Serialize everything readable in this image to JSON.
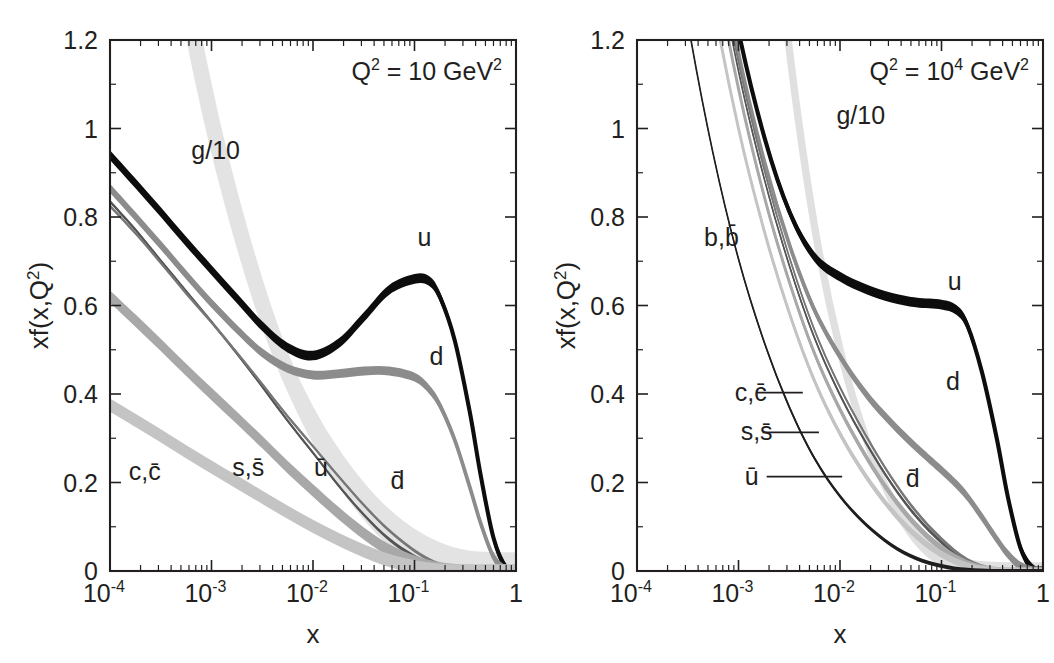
{
  "figure": {
    "background": "#ffffff",
    "ink": "#231f20"
  },
  "chart_data": [
    {
      "type": "line",
      "panel": "left",
      "title": "",
      "annotation": "Q² = 10 GeV²",
      "annotation_base": "Q",
      "annotation_exp1": "2",
      "annotation_mid": " = 10 GeV",
      "annotation_exp2": "2",
      "xlabel": "x",
      "ylabel": "xf(x,Q²)",
      "ylabel_base": "xf(x,Q",
      "ylabel_sup": "2",
      "ylabel_tail": ")",
      "xscale": "log",
      "xlim": [
        0.0001,
        1
      ],
      "ylim": [
        0,
        1.2
      ],
      "grid": false,
      "legend": "inline-labels",
      "xticks": [
        "10‑4",
        "10‑3",
        "10‑2",
        "10‑1",
        "1"
      ],
      "xtick_bases": [
        "10",
        "10",
        "10",
        "10",
        "1"
      ],
      "xtick_exps": [
        "-4",
        "-3",
        "-2",
        "-1",
        ""
      ],
      "xtick_values": [
        0.0001,
        0.001,
        0.01,
        0.1,
        1
      ],
      "yticks": [
        "0",
        "0.2",
        "0.4",
        "0.6",
        "0.8",
        "1",
        "1.2"
      ],
      "ytick_values": [
        0,
        0.2,
        0.4,
        0.6,
        0.8,
        1.0,
        1.2
      ],
      "series": [
        {
          "name": "g/10",
          "label": "g/10",
          "color": "#e3e3e3",
          "band": 0.085,
          "label_x": 0.0011,
          "label_y": 0.93,
          "leader": false,
          "x": [
            0.0001,
            0.00018,
            0.00032,
            0.00056,
            0.001,
            0.0018,
            0.0032,
            0.0056,
            0.01,
            0.018,
            0.032,
            0.056,
            0.1,
            0.18,
            0.32,
            0.56,
            1.0
          ],
          "y": [
            2.55,
            2.05,
            1.64,
            1.3,
            1.02,
            0.79,
            0.6,
            0.45,
            0.33,
            0.233,
            0.157,
            0.098,
            0.053,
            0.022,
            0.005,
            0.0004,
            0.0
          ]
        },
        {
          "name": "u",
          "label": "u",
          "color": "#0d0d0d",
          "band": 0.022,
          "label_x": 0.125,
          "label_y": 0.735,
          "leader": false,
          "x": [
            0.0001,
            0.00018,
            0.00032,
            0.00056,
            0.001,
            0.0018,
            0.0032,
            0.0056,
            0.01,
            0.018,
            0.032,
            0.056,
            0.1,
            0.14,
            0.18,
            0.25,
            0.35,
            0.45,
            0.6,
            0.8,
            1.0
          ],
          "y": [
            0.94,
            0.875,
            0.81,
            0.745,
            0.68,
            0.615,
            0.552,
            0.505,
            0.487,
            0.515,
            0.575,
            0.635,
            0.66,
            0.655,
            0.617,
            0.52,
            0.36,
            0.215,
            0.075,
            0.006,
            0.0
          ]
        },
        {
          "name": "d",
          "label": "d",
          "color": "#8c8c8c",
          "band": 0.02,
          "label_x": 0.165,
          "label_y": 0.465,
          "leader": false,
          "x": [
            0.0001,
            0.00018,
            0.00032,
            0.00056,
            0.001,
            0.0018,
            0.0032,
            0.0056,
            0.01,
            0.018,
            0.032,
            0.056,
            0.1,
            0.14,
            0.18,
            0.25,
            0.35,
            0.45,
            0.6,
            0.8,
            1.0
          ],
          "y": [
            0.865,
            0.8,
            0.735,
            0.67,
            0.605,
            0.545,
            0.492,
            0.458,
            0.443,
            0.446,
            0.452,
            0.452,
            0.438,
            0.41,
            0.372,
            0.295,
            0.19,
            0.107,
            0.032,
            0.002,
            0.0
          ]
        },
        {
          "name": "ubar",
          "label": "ū",
          "color": "#555555",
          "band": 0.008,
          "label_x": 0.012,
          "label_y": 0.215,
          "leader": false,
          "x": [
            0.0001,
            0.00018,
            0.00032,
            0.00056,
            0.001,
            0.0018,
            0.0032,
            0.0056,
            0.01,
            0.018,
            0.032,
            0.056,
            0.1,
            0.18,
            0.32,
            0.56,
            1.0
          ],
          "y": [
            0.835,
            0.77,
            0.7,
            0.633,
            0.563,
            0.49,
            0.415,
            0.34,
            0.267,
            0.192,
            0.126,
            0.072,
            0.033,
            0.0095,
            0.0012,
            0.0,
            0.0
          ]
        },
        {
          "name": "dbar",
          "label": "d̄",
          "color": "#777777",
          "band": 0.008,
          "label_x": 0.068,
          "label_y": 0.185,
          "leader": false,
          "x": [
            0.0001,
            0.00018,
            0.00032,
            0.00056,
            0.001,
            0.0018,
            0.0032,
            0.0056,
            0.01,
            0.018,
            0.032,
            0.056,
            0.1,
            0.18,
            0.32,
            0.56,
            1.0
          ],
          "y": [
            0.825,
            0.762,
            0.695,
            0.628,
            0.562,
            0.492,
            0.421,
            0.35,
            0.282,
            0.213,
            0.148,
            0.092,
            0.046,
            0.0145,
            0.002,
            0.0,
            0.0
          ]
        },
        {
          "name": "s,sbar",
          "label": "s,s̄",
          "color": "#a8a8a8",
          "band": 0.028,
          "label_x": 0.0023,
          "label_y": 0.215,
          "leader": false,
          "x": [
            0.0001,
            0.00018,
            0.00032,
            0.00056,
            0.001,
            0.0018,
            0.0032,
            0.0056,
            0.01,
            0.018,
            0.032,
            0.056,
            0.1,
            0.18,
            0.32,
            0.56,
            1.0
          ],
          "y": [
            0.62,
            0.565,
            0.51,
            0.455,
            0.4,
            0.345,
            0.29,
            0.235,
            0.182,
            0.13,
            0.084,
            0.047,
            0.021,
            0.006,
            0.0007,
            0.0,
            0.0
          ]
        },
        {
          "name": "c,cbar",
          "label": "c,c̄",
          "color": "#c4c4c4",
          "band": 0.03,
          "label_x": 0.00022,
          "label_y": 0.205,
          "leader": false,
          "x": [
            0.0001,
            0.00018,
            0.00032,
            0.00056,
            0.001,
            0.0018,
            0.0032,
            0.0056,
            0.01,
            0.018,
            0.032,
            0.056,
            0.1,
            0.18,
            0.32,
            0.56,
            1.0
          ],
          "y": [
            0.375,
            0.34,
            0.305,
            0.27,
            0.235,
            0.2,
            0.166,
            0.133,
            0.101,
            0.071,
            0.045,
            0.024,
            0.0095,
            0.002,
            0.0,
            0.0,
            0.0
          ]
        }
      ]
    },
    {
      "type": "line",
      "panel": "right",
      "title": "",
      "annotation": "Q² = 10⁴ GeV²",
      "annotation_base": "Q",
      "annotation_exp1": "2",
      "annotation_mid": " = 10",
      "annotation_exp2": "4",
      "annotation_tail": " GeV",
      "annotation_exp3": "2",
      "xlabel": "x",
      "ylabel": "xf(x,Q²)",
      "ylabel_base": "xf(x,Q",
      "ylabel_sup": "2",
      "ylabel_tail": ")",
      "xscale": "log",
      "xlim": [
        0.0001,
        1
      ],
      "ylim": [
        0,
        1.2
      ],
      "grid": false,
      "legend": "inline-labels",
      "xticks": [
        "10‑4",
        "10‑3",
        "10‑2",
        "10‑1",
        "1"
      ],
      "xtick_bases": [
        "10",
        "10",
        "10",
        "10",
        "1"
      ],
      "xtick_exps": [
        "-4",
        "-3",
        "-2",
        "-1",
        ""
      ],
      "xtick_values": [
        0.0001,
        0.001,
        0.01,
        0.1,
        1
      ],
      "yticks": [
        "0",
        "0.2",
        "0.4",
        "0.6",
        "0.8",
        "1",
        "1.2"
      ],
      "ytick_values": [
        0,
        0.2,
        0.4,
        0.6,
        0.8,
        1.0,
        1.2
      ],
      "series": [
        {
          "name": "g/10",
          "label": "g/10",
          "color": "#e0e0e0",
          "band": 0.04,
          "label_x": 0.016,
          "label_y": 1.01,
          "leader": false,
          "x": [
            0.0001,
            0.00018,
            0.00032,
            0.00056,
            0.001,
            0.0018,
            0.0032,
            0.0056,
            0.01,
            0.018,
            0.032,
            0.056,
            0.1,
            0.18,
            0.32,
            0.56,
            1.0
          ],
          "y": [
            8.6,
            6.4,
            4.7,
            3.4,
            2.43,
            1.7,
            1.17,
            0.78,
            0.5,
            0.3,
            0.163,
            0.077,
            0.029,
            0.0072,
            0.0008,
            0.0,
            0.0
          ]
        },
        {
          "name": "u",
          "label": "u",
          "color": "#0d0d0d",
          "band": 0.022,
          "label_x": 0.135,
          "label_y": 0.635,
          "leader": false,
          "x": [
            0.0001,
            0.00018,
            0.00032,
            0.00056,
            0.001,
            0.0018,
            0.0032,
            0.0056,
            0.01,
            0.018,
            0.032,
            0.056,
            0.1,
            0.14,
            0.18,
            0.25,
            0.35,
            0.45,
            0.6,
            0.8,
            1.0
          ],
          "y": [
            2.93,
            2.36,
            1.9,
            1.53,
            1.22,
            0.98,
            0.81,
            0.71,
            0.665,
            0.637,
            0.618,
            0.607,
            0.602,
            0.59,
            0.555,
            0.45,
            0.3,
            0.168,
            0.052,
            0.0035,
            0.0
          ]
        },
        {
          "name": "d",
          "label": "d",
          "color": "#8c8c8c",
          "band": 0.02,
          "label_x": 0.13,
          "label_y": 0.41,
          "leader": false,
          "x": [
            0.0001,
            0.00018,
            0.00032,
            0.00056,
            0.001,
            0.0018,
            0.0032,
            0.0056,
            0.01,
            0.018,
            0.032,
            0.056,
            0.1,
            0.14,
            0.18,
            0.25,
            0.35,
            0.45,
            0.6,
            0.8,
            1.0
          ],
          "y": [
            2.88,
            2.31,
            1.85,
            1.48,
            1.17,
            0.925,
            0.735,
            0.59,
            0.485,
            0.4,
            0.335,
            0.28,
            0.228,
            0.196,
            0.168,
            0.122,
            0.072,
            0.038,
            0.011,
            0.0007,
            0.0
          ]
        },
        {
          "name": "ubar",
          "label": "ū",
          "color": "#555555",
          "band": 0.009,
          "label_x": 0.00115,
          "label_y": 0.195,
          "leader": true,
          "leader_to_x": 0.0105,
          "x": [
            0.0001,
            0.00018,
            0.00032,
            0.00056,
            0.001,
            0.0018,
            0.0032,
            0.0056,
            0.01,
            0.018,
            0.032,
            0.056,
            0.1,
            0.18,
            0.32,
            0.56,
            1.0
          ],
          "y": [
            2.84,
            2.27,
            1.81,
            1.44,
            1.13,
            0.885,
            0.687,
            0.527,
            0.398,
            0.29,
            0.198,
            0.124,
            0.065,
            0.0215,
            0.0032,
            0.0,
            0.0
          ]
        },
        {
          "name": "dbar",
          "label": "d̄",
          "color": "#777777",
          "band": 0.009,
          "label_x": 0.052,
          "label_y": 0.19,
          "leader": false,
          "x": [
            0.0001,
            0.00018,
            0.00032,
            0.00056,
            0.001,
            0.0018,
            0.0032,
            0.0056,
            0.01,
            0.018,
            0.032,
            0.056,
            0.1,
            0.18,
            0.32,
            0.56,
            1.0
          ],
          "y": [
            2.86,
            2.29,
            1.83,
            1.46,
            1.15,
            0.905,
            0.706,
            0.545,
            0.415,
            0.306,
            0.212,
            0.135,
            0.0725,
            0.0248,
            0.0038,
            0.0,
            0.0
          ]
        },
        {
          "name": "s,sbar",
          "label": "s,s̄",
          "color": "#a8a8a8",
          "band": 0.016,
          "label_x": 0.00105,
          "label_y": 0.295,
          "leader": true,
          "leader_to_x": 0.0062,
          "x": [
            0.0001,
            0.00018,
            0.00032,
            0.00056,
            0.001,
            0.0018,
            0.0032,
            0.0056,
            0.01,
            0.018,
            0.032,
            0.056,
            0.1,
            0.18,
            0.32,
            0.56,
            1.0
          ],
          "y": [
            2.76,
            2.2,
            1.75,
            1.39,
            1.09,
            0.845,
            0.65,
            0.492,
            0.365,
            0.259,
            0.172,
            0.104,
            0.052,
            0.0165,
            0.0022,
            0.0,
            0.0
          ]
        },
        {
          "name": "c,cbar",
          "label": "c,c̄",
          "color": "#c4c4c4",
          "band": 0.016,
          "label_x": 0.00092,
          "label_y": 0.385,
          "leader": true,
          "leader_to_x": 0.0043,
          "x": [
            0.0001,
            0.00018,
            0.00032,
            0.00056,
            0.001,
            0.0018,
            0.0032,
            0.0056,
            0.01,
            0.018,
            0.032,
            0.056,
            0.1,
            0.18,
            0.32,
            0.56,
            1.0
          ],
          "y": [
            2.6,
            2.07,
            1.64,
            1.29,
            1.0,
            0.767,
            0.58,
            0.43,
            0.31,
            0.214,
            0.138,
            0.08,
            0.038,
            0.0112,
            0.0013,
            0.0,
            0.0
          ]
        },
        {
          "name": "b,bbar",
          "label": "b,b̄",
          "color": "#1f1f1f",
          "band": 0.009,
          "label_x": 0.00068,
          "label_y": 0.735,
          "leader": false,
          "x": [
            0.0001,
            0.00018,
            0.00032,
            0.00056,
            0.001,
            0.0018,
            0.0032,
            0.0056,
            0.01,
            0.018,
            0.032,
            0.056,
            0.1,
            0.18,
            0.32,
            0.56,
            1.0
          ],
          "y": [
            2.05,
            1.6,
            1.235,
            0.945,
            0.705,
            0.516,
            0.368,
            0.255,
            0.169,
            0.105,
            0.059,
            0.029,
            0.0115,
            0.0026,
            0.0002,
            0.0,
            0.0
          ]
        }
      ]
    }
  ]
}
